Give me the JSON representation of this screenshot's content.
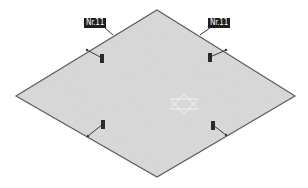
{
  "diagram": {
    "plate": {
      "fill": "#d9d9d9",
      "stroke": "#5a5a5a",
      "vertices": {
        "top": [
          157,
          10
        ],
        "right": [
          295,
          96
        ],
        "bottom": [
          157,
          177
        ],
        "left": [
          16,
          96
        ]
      }
    },
    "labels": [
      {
        "id": "label-top-left",
        "text": "Nr.11",
        "x": 84,
        "y": 18
      },
      {
        "id": "label-top-right",
        "text": "Nr.11",
        "x": 208,
        "y": 18
      }
    ],
    "markers": [
      {
        "id": "marker-upper-left",
        "x": 100,
        "y": 54,
        "edge_point": [
          87,
          50
        ]
      },
      {
        "id": "marker-upper-right",
        "x": 208,
        "y": 53,
        "edge_point": [
          226,
          50
        ]
      },
      {
        "id": "marker-lower-left",
        "x": 101,
        "y": 120,
        "edge_point": [
          88,
          136
        ]
      },
      {
        "id": "marker-lower-right",
        "x": 211,
        "y": 121,
        "edge_point": [
          226,
          135
        ]
      }
    ],
    "center_symbol": {
      "type": "hexagram",
      "cx": 184,
      "cy": 104,
      "r": 16,
      "color": "#f4f4f4"
    },
    "colors": {
      "label_bg": "#1e1e1e",
      "label_text": "#ffffff",
      "marker": "#2a2a2a",
      "leader": "#3a3a3a"
    }
  }
}
